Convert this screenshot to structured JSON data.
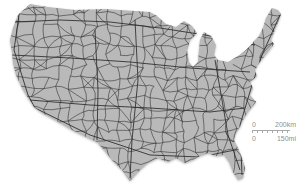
{
  "map": {
    "name": "united-states-road-network-map",
    "background_color": "#ffffff",
    "land_color": "#b9b9b9",
    "road_color": "#333333",
    "major_road_color": "#2a2a2a",
    "outline_path": "M30,4 L48,7 L75,10 L105,9 L135,11 L150,12 L157,16 L166,24 L176,27 L184,21 L192,26 L197,33 L190,40 L187,50 L189,62 L193,67 L198,62 L199,50 L200,40 L204,32 L211,36 L216,45 L214,55 L218,60 L228,62 L240,55 L247,49 L251,45 L254,41 L259,36 L263,28 L266,18 L272,8 L278,10 L281,14 L277,25 L274,32 L271,40 L274,44 L268,52 L263,58 L259,63 L255,70 L257,76 L250,82 L253,88 L250,95 L256,102 L248,112 L243,120 L240,127 L236,133 L234,140 L238,148 L242,158 L245,168 L243,178 L238,180 L233,172 L229,162 L224,155 L216,156 L208,153 L200,156 L193,160 L185,163 L176,158 L168,162 L158,158 L148,163 L140,170 L130,181 L122,170 L112,160 L104,150 L97,142 L88,138 L72,130 L55,120 L42,113 L34,107 L28,98 L22,88 L16,75 L13,63 L12,52 L10,40 L13,28 L18,15 Z",
    "network": {
      "seed": 7,
      "x_start": 6,
      "x_end": 290,
      "y_start": 4,
      "y_end": 184,
      "col_step_start": 13.5,
      "col_step_end": 8.5,
      "row_step": 10.5,
      "jitter": 7,
      "edge_prob": 0.88,
      "diag_prob": 0.16,
      "minor_width": 0.6,
      "major_width": 0.85
    },
    "major_routes": [
      [
        [
          15,
          22
        ],
        [
          60,
          20
        ],
        [
          110,
          22
        ],
        [
          160,
          28
        ],
        [
          205,
          35
        ],
        [
          255,
          45
        ]
      ],
      [
        [
          12,
          55
        ],
        [
          70,
          58
        ],
        [
          130,
          62
        ],
        [
          190,
          68
        ],
        [
          250,
          72
        ]
      ],
      [
        [
          30,
          100
        ],
        [
          90,
          105
        ],
        [
          150,
          108
        ],
        [
          210,
          112
        ],
        [
          245,
          108
        ]
      ],
      [
        [
          35,
          108
        ],
        [
          90,
          135
        ],
        [
          150,
          155
        ],
        [
          200,
          157
        ],
        [
          235,
          150
        ]
      ],
      [
        [
          280,
          15
        ],
        [
          262,
          55
        ],
        [
          252,
          85
        ],
        [
          240,
          125
        ],
        [
          242,
          175
        ]
      ],
      [
        [
          20,
          8
        ],
        [
          14,
          50
        ],
        [
          28,
          95
        ],
        [
          35,
          108
        ]
      ],
      [
        [
          135,
          20
        ],
        [
          138,
          80
        ],
        [
          132,
          140
        ],
        [
          130,
          178
        ]
      ],
      [
        [
          95,
          30
        ],
        [
          98,
          90
        ],
        [
          97,
          140
        ]
      ],
      [
        [
          215,
          60
        ],
        [
          222,
          100
        ],
        [
          228,
          135
        ],
        [
          240,
          170
        ]
      ]
    ]
  },
  "scalebar": {
    "km_zero": "0",
    "km_label": "200km",
    "mi_zero": "0",
    "mi_label": "150mi",
    "text_color": "#8f8f8f",
    "ruler_color": "#a8a8a8"
  }
}
